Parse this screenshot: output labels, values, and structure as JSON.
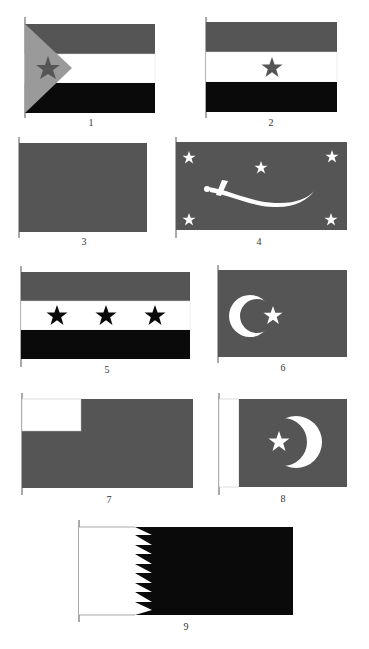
{
  "colors": {
    "red": "#555555",
    "white": "#ffffff",
    "black": "#0a0a0a",
    "light": "#9a9a9a",
    "pole": "#555555"
  },
  "flags": [
    {
      "number": "1",
      "description": "Horizontal tricolor (dark/white/black) with light hoist triangle bearing a dark star"
    },
    {
      "number": "2",
      "description": "Horizontal tricolor (dark/white/black) with a dark star in the white stripe"
    },
    {
      "number": "3",
      "description": "Plain dark field"
    },
    {
      "number": "4",
      "description": "Dark field with a white curved sword and five white stars"
    },
    {
      "number": "5",
      "description": "Horizontal tricolor (dark/white/black) with three dark stars in the white stripe"
    },
    {
      "number": "6",
      "description": "Dark field with a white crescent and star"
    },
    {
      "number": "7",
      "description": "Dark field with a white canton"
    },
    {
      "number": "8",
      "description": "Dark field with white hoist band, white star and crescent"
    },
    {
      "number": "9",
      "description": "White hoist and dark field separated by a serrated edge of nine points"
    }
  ]
}
